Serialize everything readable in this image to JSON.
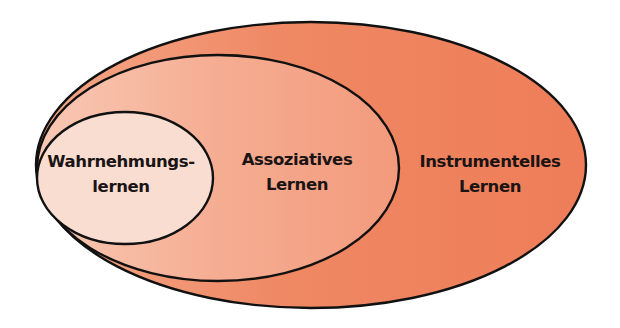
{
  "diagram": {
    "type": "nested-ellipses",
    "colors": {
      "outer_light": "#f29a78",
      "outer": "#ef7f5b",
      "middle_light": "#f7bea6",
      "middle": "#f39a7d",
      "inner": "#f9ddd1",
      "stroke": "#111111",
      "text": "#1a1414"
    },
    "sets": [
      {
        "id": "instrumentelles",
        "level": "outer",
        "lines": [
          "Instrumentelles",
          "Lernen"
        ]
      },
      {
        "id": "assoziatives",
        "level": "middle",
        "lines": [
          "Assoziatives",
          "Lernen"
        ]
      },
      {
        "id": "wahrnehmungs",
        "level": "inner",
        "lines": [
          "Wahrnehmungs-",
          "lernen"
        ]
      }
    ]
  }
}
